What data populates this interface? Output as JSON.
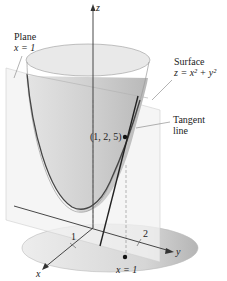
{
  "diagram": {
    "title": "",
    "axes": {
      "z_label": "z",
      "x_label": "x",
      "y_label": "y",
      "x_tick": "1",
      "y_tick": "2"
    },
    "labels": {
      "plane_line1": "Plane",
      "plane_line2": "x = 1",
      "surface_line1": "Surface",
      "surface_line2": "z = x² + y²",
      "tangent_line1": "Tangent",
      "tangent_line2": "line",
      "point": "(1, 2, 5)",
      "base_label": "x = 1"
    },
    "colors": {
      "surface_fill": "#d9d9d9",
      "surface_dark": "#bdbdbd",
      "plane_fill": "#f0f0f0",
      "ink": "#333333"
    }
  }
}
